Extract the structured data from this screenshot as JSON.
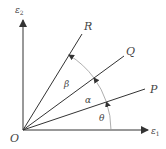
{
  "diagram": {
    "origin_label": "O",
    "axes": {
      "x_axis": {
        "label": "ε",
        "subscript": "1"
      },
      "y_axis": {
        "label": "ε",
        "subscript": "2"
      }
    },
    "rays": [
      {
        "label": "P"
      },
      {
        "label": "Q"
      },
      {
        "label": "R"
      }
    ],
    "angles": [
      {
        "label": "θ",
        "between": "e1 axis and OP"
      },
      {
        "label": "α",
        "between": "OP and OQ"
      },
      {
        "label": "β",
        "between": "OQ and OR"
      }
    ],
    "colors": {
      "line": "#333333",
      "arc": "#888888",
      "text": "#444444"
    }
  }
}
